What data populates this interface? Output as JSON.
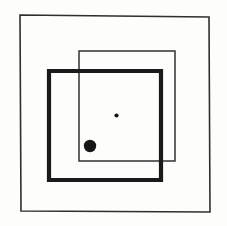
{
  "canvas": {
    "width": 227,
    "height": 226,
    "background_color": "#fdfdfc",
    "ink_color": "#1a1a1a",
    "thin_ink_color": "#2f2f2f",
    "description": "Hand-drawn sketch: three nested/overlapping squares with two filled dots"
  },
  "figure": {
    "title": "",
    "shapes": [
      {
        "name": "outer-frame-square",
        "kind": "square-outline",
        "stroke_width": 1.6,
        "stroke_color": "#2f2f2f",
        "fill": "none",
        "points": "20,15 209,17 210,212 21,211",
        "bounds": {
          "x": 20,
          "y": 15,
          "width": 190,
          "height": 197
        }
      },
      {
        "name": "thin-inner-square",
        "kind": "square-outline",
        "stroke_width": 1.5,
        "stroke_color": "#313131",
        "fill": "none",
        "points": "79,51 175,51 175,161 79,161",
        "bounds": {
          "x": 79,
          "y": 51,
          "width": 96,
          "height": 110
        }
      },
      {
        "name": "thick-bold-square",
        "kind": "square-outline",
        "stroke_width": 4.2,
        "stroke_color": "#1a1a1a",
        "fill": "none",
        "points": "49,71 161,71 161,180 49,180",
        "bounds": {
          "x": 49,
          "y": 71,
          "width": 112,
          "height": 109
        }
      }
    ],
    "dots": [
      {
        "name": "large-filled-dot",
        "kind": "filled-circle",
        "cx": 90,
        "cy": 146,
        "r": 6.2,
        "fill": "#161616"
      },
      {
        "name": "small-filled-dot",
        "kind": "filled-circle",
        "cx": 116.5,
        "cy": 115.5,
        "r": 2.1,
        "fill": "#161616"
      }
    ]
  }
}
